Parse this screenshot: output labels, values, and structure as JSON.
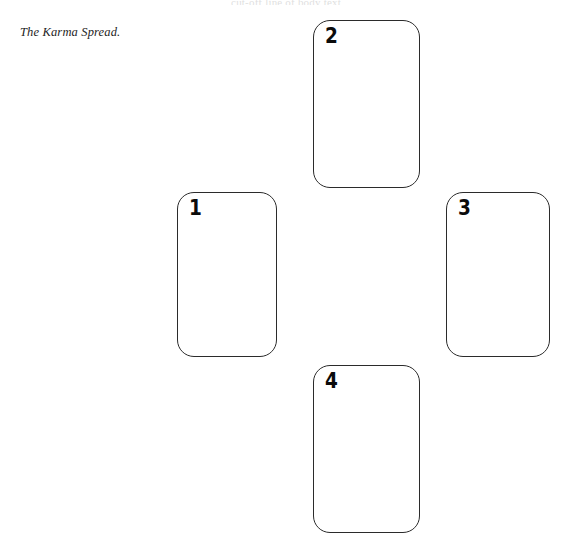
{
  "page": {
    "background_color": "#ffffff",
    "width": 572,
    "height": 554,
    "clipped_top_line": "cut-off line of body text"
  },
  "caption": {
    "text": "The Karma Spread.",
    "style": "italic-serif",
    "color": "#1d1d1d"
  },
  "spread": {
    "name": "The Karma Spread",
    "layout": "cross",
    "card_count": 4,
    "outline_color": "#2b2b2b",
    "fill_color": "#ffffff",
    "number_color": "#0b0b0b",
    "cards": [
      {
        "number": "1",
        "position_name": "left",
        "x": 177,
        "y": 192,
        "width": 100,
        "height": 165
      },
      {
        "number": "2",
        "position_name": "top",
        "x": 313,
        "y": 20,
        "width": 107,
        "height": 168
      },
      {
        "number": "3",
        "position_name": "right",
        "x": 446,
        "y": 192,
        "width": 104,
        "height": 165
      },
      {
        "number": "4",
        "position_name": "bottom",
        "x": 313,
        "y": 365,
        "width": 107,
        "height": 168
      }
    ]
  }
}
